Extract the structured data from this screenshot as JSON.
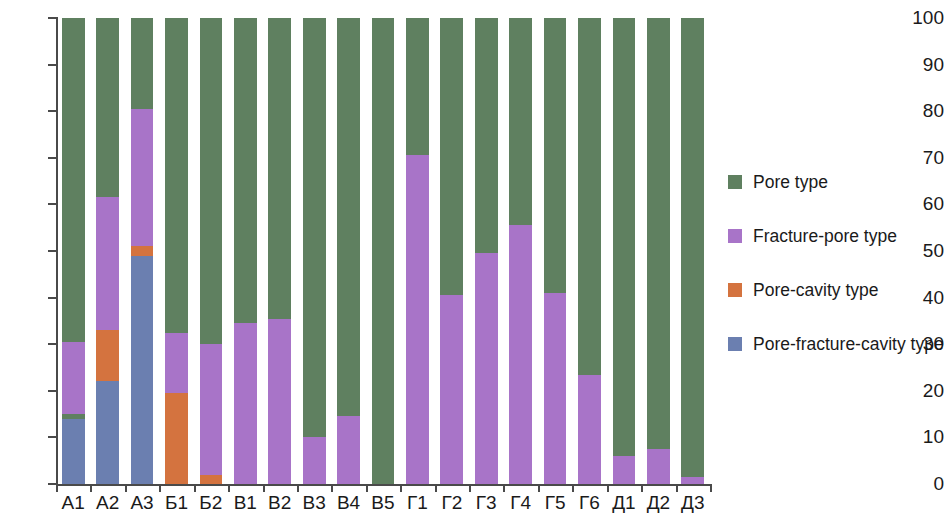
{
  "chart_data": {
    "type": "bar",
    "stacked": true,
    "title": "",
    "subtitle": "",
    "xlabel": "",
    "ylabel": "",
    "ylim": [
      0,
      100
    ],
    "yticks": [
      0,
      10,
      20,
      30,
      40,
      50,
      60,
      70,
      80,
      90,
      100
    ],
    "ytick_labels": [
      "0",
      "10",
      "20",
      "30",
      "40",
      "50",
      "60",
      "70",
      "80",
      "90",
      "100"
    ],
    "grid": false,
    "legend_position": "right",
    "categories": [
      "А1",
      "А2",
      "А3",
      "Б1",
      "Б2",
      "В1",
      "В2",
      "В3",
      "В4",
      "В5",
      "Г1",
      "Г2",
      "Г3",
      "Г4",
      "Г5",
      "Г6",
      "Д1",
      "Д2",
      "Д3"
    ],
    "series": [
      {
        "name": "Pore-fracture-cavity type",
        "color": "#6b7fb0",
        "values": [
          14,
          22,
          49,
          0,
          0,
          0,
          0,
          0,
          0,
          0,
          0,
          0,
          0,
          0,
          0,
          0,
          0,
          0,
          0
        ]
      },
      {
        "name": "Pore-cavity type",
        "color": "#d4733f",
        "values": [
          0,
          11,
          2,
          19.5,
          2,
          0,
          0,
          0,
          0,
          0,
          0,
          0,
          0,
          0,
          0,
          0,
          0,
          0,
          0
        ]
      },
      {
        "name": "Pore type",
        "color": "#5f8060",
        "values": [
          1,
          0,
          0,
          0,
          0,
          0,
          0,
          0,
          0,
          0,
          0,
          0,
          0,
          0,
          0,
          0,
          0,
          0,
          0
        ],
        "note": "thin sliver segment inside bar А1 between the blue and purple segments"
      },
      {
        "name": "Fracture-pore type",
        "color": "#a874c8",
        "values": [
          15.5,
          28.5,
          29.5,
          13,
          28,
          34.5,
          35.5,
          10,
          14.5,
          0,
          70.5,
          40.5,
          49.5,
          55.5,
          41,
          23.5,
          6,
          7.5,
          1.5
        ]
      },
      {
        "name": "Pore type",
        "color": "#5f8060",
        "values": [
          69.5,
          38.5,
          19.5,
          67.5,
          70,
          65.5,
          64.5,
          90,
          85.5,
          100,
          29.5,
          59.5,
          50.5,
          44.5,
          59,
          76.5,
          94,
          92.5,
          98.5
        ],
        "note": "top remainder segment reaching 100"
      }
    ],
    "stack_tops": {
      "А1": {
        "blue": 14,
        "green_sliver": 15,
        "purple": 30.5,
        "green": 100
      },
      "А2": {
        "blue": 22,
        "orange": 33,
        "purple": 61.5,
        "green": 100
      },
      "А3": {
        "blue": 49,
        "orange": 51,
        "purple": 80.5,
        "green": 100
      },
      "Б1": {
        "orange": 19.5,
        "purple": 32.5,
        "green": 100
      },
      "Б2": {
        "orange": 2,
        "purple": 30,
        "green": 100
      },
      "В1": {
        "purple": 34.5,
        "green": 100
      },
      "В2": {
        "purple": 35.5,
        "green": 100
      },
      "В3": {
        "purple": 10,
        "green": 100
      },
      "В4": {
        "purple": 14.5,
        "green": 100
      },
      "В5": {
        "green": 100
      },
      "Г1": {
        "purple": 70.5,
        "green": 100
      },
      "Г2": {
        "purple": 40.5,
        "green": 100
      },
      "Г3": {
        "purple": 49.5,
        "green": 100
      },
      "Г4": {
        "purple": 55.5,
        "green": 100
      },
      "Г5": {
        "purple": 41,
        "green": 100
      },
      "Г6": {
        "purple": 23.5,
        "green": 100
      },
      "Д1": {
        "purple": 6,
        "green": 100
      },
      "Д2": {
        "purple": 7.5,
        "green": 100
      },
      "Д3": {
        "purple": 1.5,
        "green": 100
      }
    }
  },
  "legend": {
    "items": [
      {
        "label": "Pore type",
        "color": "#5f8060"
      },
      {
        "label": "Fracture-pore type",
        "color": "#a874c8"
      },
      {
        "label": "Pore-cavity type",
        "color": "#d4733f"
      },
      {
        "label": "Pore-fracture-cavity type",
        "color": "#6b7fb0"
      }
    ]
  },
  "colors": {
    "pore": "#5f8060",
    "fracture_pore": "#a874c8",
    "pore_cavity": "#d4733f",
    "pore_fracture_cavity": "#6b7fb0",
    "axis": "#4a4a4a",
    "text": "#1a1a1a",
    "background": "#ffffff"
  }
}
